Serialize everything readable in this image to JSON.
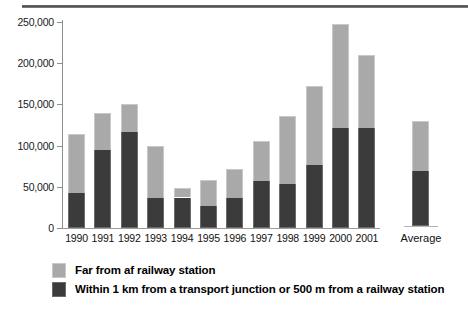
{
  "chart_data": {
    "type": "bar",
    "subtype": "stacked-bar",
    "title": "",
    "xlabel": "",
    "ylabel": "",
    "ylim": [
      0,
      250000
    ],
    "yticks": [
      0,
      50000,
      100000,
      150000,
      200000,
      250000
    ],
    "ytick_labels": [
      "0",
      "50,000",
      "100,000",
      "150,000",
      "200,000",
      "250,000"
    ],
    "grid": false,
    "legend_position": "bottom-left",
    "categories": [
      "1990",
      "1991",
      "1992",
      "1993",
      "1994",
      "1995",
      "1996",
      "1997",
      "1998",
      "1999",
      "2000",
      "2001",
      "Average"
    ],
    "series": [
      {
        "name": "Within 1 km from a transport junction or 500 m from a railway station",
        "color": "#3b3b3b",
        "values": [
          43000,
          95000,
          116000,
          37000,
          37000,
          27000,
          36000,
          57000,
          53000,
          77000,
          121000,
          121000,
          67000
        ]
      },
      {
        "name": "Far from af railway station",
        "color": "#a9a9a9",
        "values": [
          71000,
          45000,
          35000,
          62000,
          12000,
          31000,
          36000,
          49000,
          83000,
          95000,
          127000,
          89000,
          61000
        ]
      }
    ],
    "totals": [
      114000,
      140000,
      151000,
      99000,
      49000,
      58000,
      72000,
      106000,
      136000,
      172000,
      248000,
      210000,
      128000
    ]
  },
  "legend": {
    "items": [
      {
        "label": "Far from af railway station",
        "swatch": "light"
      },
      {
        "label": "Within 1 km from a transport junction or 500 m from a railway station",
        "swatch": "dark"
      }
    ]
  }
}
